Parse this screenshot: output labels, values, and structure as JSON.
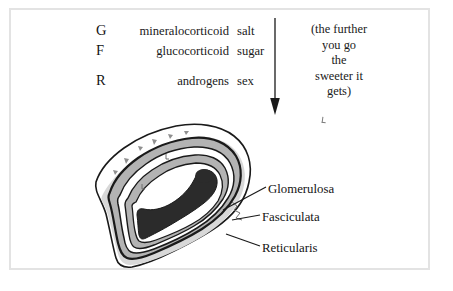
{
  "figure": {
    "frame_color": "#e3e3e3",
    "background": "#ffffff"
  },
  "mnemonic": {
    "rows": [
      {
        "letter": "G",
        "hormone": "mineralocorticoid",
        "effect": "salt"
      },
      {
        "letter": "F",
        "hormone": "glucocorticoid",
        "effect": "sugar"
      },
      {
        "letter": "R",
        "hormone": "androgens",
        "effect": "sex"
      }
    ]
  },
  "note": {
    "lines": [
      "(the further",
      "you go",
      "the",
      "sweeter it",
      "gets)"
    ]
  },
  "arrow": {
    "direction": "down",
    "color": "#1a1a1a"
  },
  "labels": {
    "glomerulosa": "Glomerulosa",
    "fasciculata": "Fasciculata",
    "reticularis": "Reticularis"
  },
  "gland": {
    "colors": {
      "capsule_outline": "#1a1a1a",
      "capsule_fill": "#ffffff",
      "cortex_fill": "#b3b3b3",
      "band_fill": "#ffffff",
      "medulla_fill": "#2b2b2b",
      "shadow_fill": "#d8d8d8"
    }
  },
  "caption_remnant": {
    "text": " "
  }
}
